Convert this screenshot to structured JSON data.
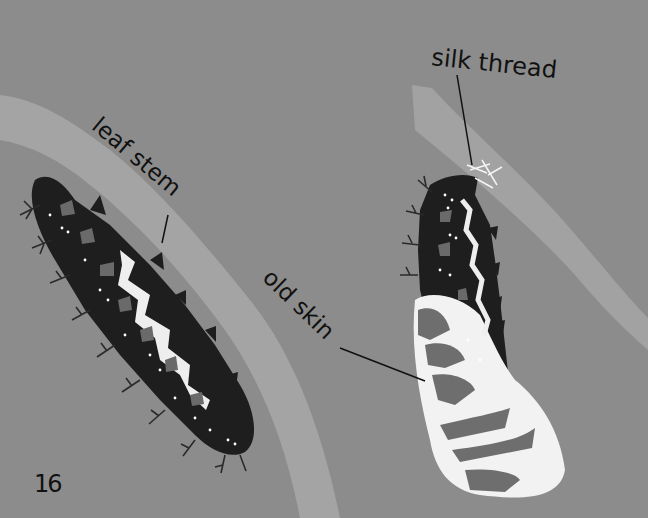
{
  "page": {
    "number": "16",
    "background_color": "#8c8c8c"
  },
  "labels": {
    "leaf_stem": "leaf stem",
    "silk_thread": "silk thread",
    "old_skin": "old skin"
  },
  "figures": [
    {
      "name": "caterpillar-on-leaf-stem",
      "description": "spiky dark caterpillar lying along a leaf stem"
    },
    {
      "name": "caterpillar-shedding-skin",
      "description": "caterpillar hanging by a silk thread, shedding its old skin"
    }
  ],
  "colors": {
    "background": "#8c8c8c",
    "leaf_stem": "#a4a4a4",
    "caterpillar_body": "#1e1e1e",
    "caterpillar_patch": "#6a6a6a",
    "old_skin": "#f2f2f2",
    "old_skin_spots": "#6e6e6e",
    "silk": "#f4f4f4",
    "ink": "#111111"
  }
}
